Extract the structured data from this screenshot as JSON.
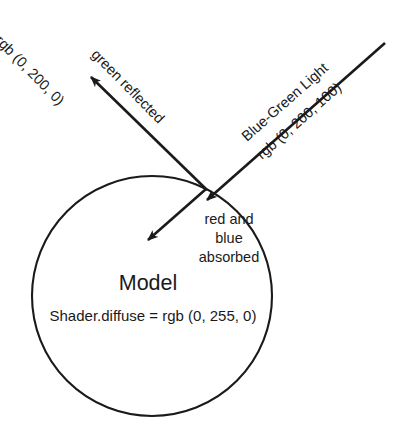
{
  "diagram": {
    "background_color": "#ffffff",
    "stroke_color": "#1a1a1a",
    "model": {
      "name_label": "Model",
      "shader_label": "Shader.diffuse = rgb (0, 255, 0)",
      "shape": "circle"
    },
    "rays": {
      "incoming": {
        "name_label": "Blue-Green Light",
        "value_label": "rgb (0, 200, 100)"
      },
      "reflected": {
        "name_label": "green reflected",
        "value_label": "rgb (0, 200, 0)"
      },
      "absorbed": {
        "line1": "red and",
        "line2": "blue",
        "line3": "absorbed"
      }
    }
  }
}
